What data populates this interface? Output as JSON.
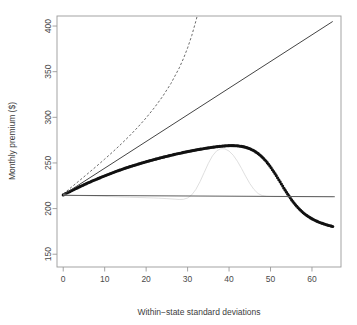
{
  "chart_data": {
    "type": "line",
    "title": "",
    "xlabel": "Within−state standard deviations",
    "ylabel": "Monthly premium ($)",
    "xlim": [
      -1.5,
      67
    ],
    "ylim": [
      136,
      411
    ],
    "xticks": [
      0,
      10,
      20,
      30,
      40,
      50,
      60
    ],
    "xtick_labels": [
      "0",
      "10",
      "20",
      "30",
      "40",
      "50",
      "60"
    ],
    "yticks": [
      150,
      200,
      250,
      300,
      350,
      400
    ],
    "ytick_labels": [
      "150",
      "200",
      "250",
      "300",
      "350",
      "400"
    ],
    "grid": false,
    "legend": "none",
    "box": true,
    "series": [
      {
        "name": "thick-dotted-hump",
        "style": "dotted-thick",
        "color": "#111111",
        "x": [
          0,
          1,
          2,
          3,
          4,
          5,
          6,
          7,
          8,
          9,
          10,
          11,
          12,
          13,
          14,
          15,
          16,
          17,
          18,
          19,
          20,
          21,
          22,
          23,
          24,
          25,
          26,
          27,
          28,
          29,
          30,
          31,
          32,
          33,
          34,
          35,
          36,
          37,
          38,
          39,
          40,
          41,
          42,
          43,
          44,
          45,
          46,
          47,
          48,
          49,
          50,
          51,
          52,
          53,
          54,
          55,
          56,
          57,
          58,
          59,
          60,
          61,
          62,
          63,
          64,
          65
        ],
        "y": [
          215.0,
          217.3,
          219.6,
          221.8,
          224.0,
          226.1,
          228.2,
          230.2,
          232.1,
          234.0,
          235.9,
          237.7,
          239.4,
          241.1,
          242.7,
          244.3,
          245.8,
          247.2,
          248.6,
          250.0,
          251.3,
          252.6,
          253.8,
          255.0,
          256.2,
          257.3,
          258.4,
          259.5,
          260.5,
          261.5,
          262.4,
          263.3,
          264.2,
          265.0,
          265.8,
          266.5,
          267.2,
          267.8,
          268.3,
          268.7,
          269.0,
          269.0,
          268.8,
          268.2,
          267.2,
          265.6,
          263.4,
          260.4,
          256.5,
          251.6,
          245.7,
          238.9,
          231.6,
          224.1,
          216.8,
          210.1,
          204.2,
          199.2,
          195.0,
          191.6,
          188.8,
          186.5,
          184.6,
          183.0,
          181.6,
          180.4
        ]
      },
      {
        "name": "solid-diagonal-reference",
        "style": "solid-thin",
        "color": "#3a3a3a",
        "x": [
          0,
          65
        ],
        "y": [
          215.0,
          405.0
        ]
      },
      {
        "name": "dashed-steep-rise",
        "style": "dashed-thin",
        "color": "#6b6b6b",
        "x": [
          0,
          2,
          4,
          6,
          8,
          10,
          12,
          14,
          16,
          18,
          20,
          22,
          24,
          26,
          28,
          29,
          30,
          31,
          32,
          32.6,
          33.1,
          33.5,
          33.8,
          34.0,
          34.1
        ],
        "y": [
          216.0,
          223.5,
          231.0,
          238.6,
          246.3,
          254.2,
          262.3,
          270.8,
          279.7,
          289.2,
          299.4,
          310.6,
          323.0,
          337.2,
          354.2,
          364.4,
          376.0,
          389.5,
          405.5,
          416.0,
          427.0,
          437.0,
          446.0,
          452.0,
          456.0
        ]
      },
      {
        "name": "faint-gray-bump",
        "style": "solid-faint",
        "color": "#d2d2d2",
        "x": [
          0,
          4,
          8,
          12,
          16,
          20,
          23,
          25,
          27,
          28,
          29,
          30,
          31,
          32,
          33,
          34,
          35,
          36,
          37,
          38,
          39,
          40,
          41,
          42,
          43,
          44,
          45,
          46,
          47,
          48,
          49,
          50,
          52,
          56,
          60,
          65
        ],
        "y": [
          215.0,
          214.3,
          213.6,
          213.0,
          212.4,
          211.9,
          211.4,
          210.9,
          210.3,
          210.0,
          210.2,
          211.6,
          215.0,
          221.0,
          229.5,
          239.5,
          249.5,
          257.8,
          263.2,
          265.6,
          265.4,
          263.0,
          258.5,
          252.0,
          244.0,
          235.5,
          227.5,
          221.0,
          216.5,
          214.2,
          213.4,
          213.2,
          213.1,
          213.0,
          213.0,
          213.0
        ]
      },
      {
        "name": "horizontal-baseline",
        "style": "solid-thin",
        "color": "#555555",
        "x": [
          0,
          65.5
        ],
        "y": [
          214.5,
          213.0
        ]
      }
    ]
  },
  "axes": {
    "x_label": "Within−state standard deviations",
    "y_label": "Monthly premium ($)"
  }
}
